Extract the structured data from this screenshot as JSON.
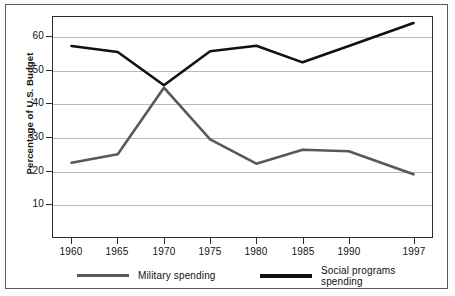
{
  "chart_data": {
    "type": "line",
    "title": "",
    "xlabel": "",
    "ylabel": "Percentage of U.S. Budget",
    "categories": [
      "1960",
      "1965",
      "1970",
      "1975",
      "1980",
      "1985",
      "1990",
      "1997"
    ],
    "x": [
      1960,
      1965,
      1970,
      1975,
      1980,
      1985,
      1990,
      1997
    ],
    "xlim": [
      1958,
      1999
    ],
    "ylim": [
      0,
      66
    ],
    "ytick_labels": [
      "10",
      "20",
      "30",
      "40",
      "50",
      "60"
    ],
    "yticks": [
      10,
      20,
      30,
      40,
      50,
      60
    ],
    "grid": "horizontal",
    "legend_position": "below",
    "series": [
      {
        "name": "Military spending",
        "color": "#595959",
        "values": [
          22.3,
          24.8,
          44.8,
          29.3,
          22.0,
          26.2,
          25.7,
          18.8
        ]
      },
      {
        "name": "Social programs spending",
        "color": "#111111",
        "values": [
          57.3,
          55.5,
          45.5,
          55.7,
          57.4,
          52.4,
          57.3,
          64.2
        ]
      }
    ]
  },
  "axis": {
    "y_title": "Percentage of U.S. Budget"
  },
  "legend": {
    "items": [
      {
        "label": "Military spending",
        "color": "#595959"
      },
      {
        "label": "Social programs\nspending",
        "color": "#111111"
      }
    ]
  }
}
